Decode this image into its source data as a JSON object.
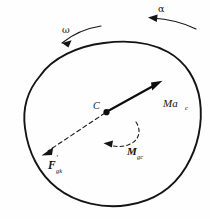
{
  "figure": {
    "background_color": "#fefefe",
    "stroke_color": "#141414",
    "body": {
      "name": "rigid-body-outline",
      "style": "solid",
      "fill": "none",
      "stroke_width": 1.9
    },
    "labels": {
      "omega": "ω",
      "alpha": "α",
      "center_of_mass": "C",
      "inertia_force_resultant": "Ma",
      "inertia_force_resultant_sub": "c",
      "inertia_moment": "M",
      "inertia_moment_sub": "gc",
      "inertia_force": "F",
      "inertia_force_prime": "′",
      "inertia_force_sub": "gk"
    },
    "arrows": {
      "omega_arc": {
        "name": "angular-velocity-arrow",
        "style": "solid",
        "direction": "counterclockwise-left"
      },
      "alpha_arc": {
        "name": "angular-acceleration-arrow",
        "style": "solid",
        "direction": "left"
      },
      "ma_c_vector": {
        "name": "inertia-force-resultant-vector",
        "style": "solid",
        "direction": "up-right"
      },
      "f_gk_vector": {
        "name": "inertia-force-vector",
        "style": "dashed",
        "direction": "down-left"
      },
      "m_gc_arc": {
        "name": "inertia-moment-arc-arrow",
        "style": "dashed",
        "direction": "clockwise-left"
      }
    },
    "center_dot": {
      "name": "center-of-mass-dot",
      "color": "#0d0d0d",
      "radius": 3.1
    }
  }
}
